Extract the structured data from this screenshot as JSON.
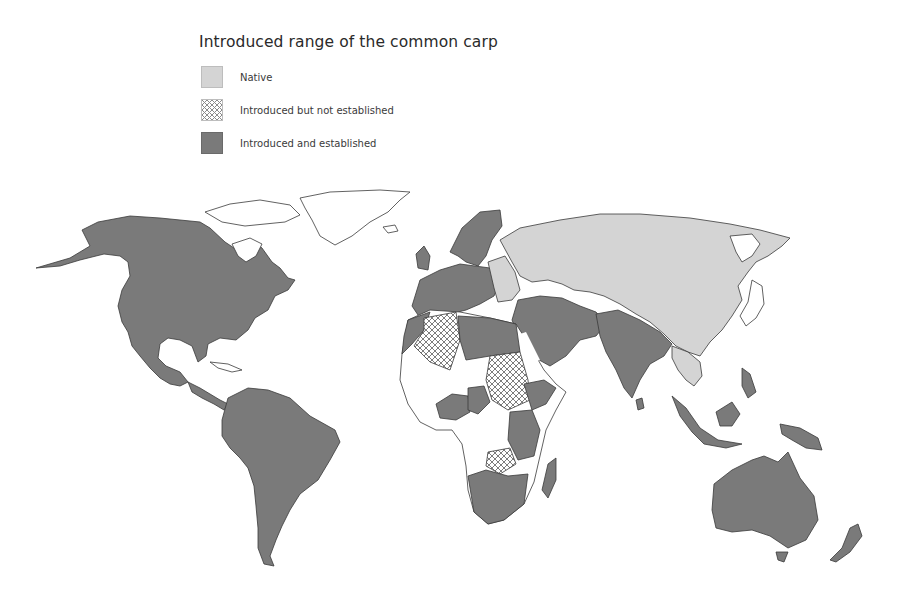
{
  "map": {
    "title": "Introduced range of the common carp",
    "legend": [
      {
        "key": "native",
        "label": "Native",
        "color": "#d4d4d4",
        "pattern": "solid"
      },
      {
        "key": "introduced_not_established",
        "label": "Introduced but not established",
        "color": "#8a8a8a",
        "pattern": "crosshatch"
      },
      {
        "key": "introduced_established",
        "label": "Introduced and established",
        "color": "#7a7a7a",
        "pattern": "solid"
      }
    ],
    "regions": {
      "native": [
        "Russia",
        "Kazakhstan",
        "Mongolia",
        "China",
        "Eastern Europe",
        "Central Asia",
        "Southeast Asia (Indochina)"
      ],
      "introduced_not_established": [
        "Algeria",
        "Sudan",
        "Zimbabwe"
      ],
      "introduced_established": [
        "North America",
        "Central America",
        "South America",
        "Western Europe",
        "North Africa",
        "Middle East",
        "South Asia",
        "Southern Africa",
        "East Africa",
        "Madagascar",
        "Indonesia",
        "Philippines",
        "Papua New Guinea",
        "Australia",
        "New Zealand"
      ],
      "no_data": [
        "Greenland",
        "West Africa (parts)",
        "Central Africa (parts)",
        "Japan coast",
        "Arctic islands"
      ]
    },
    "colors": {
      "background": "#ffffff",
      "outline": "#3a3a3a",
      "no_data_fill": "#ffffff"
    }
  }
}
